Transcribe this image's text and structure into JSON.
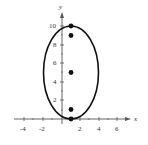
{
  "diagram": {
    "type": "ellipse-plot",
    "axes": {
      "x_label": "x",
      "y_label": "y",
      "x_ticks": [
        "-4",
        "-2",
        "2",
        "4",
        "6"
      ],
      "y_ticks": [
        "2",
        "4",
        "6",
        "8",
        "10"
      ],
      "xlim": [
        -5,
        7
      ],
      "ylim": [
        0,
        11
      ]
    },
    "ellipse": {
      "center": [
        1,
        5
      ],
      "semi_major_vertical": 5,
      "semi_minor_horizontal": 3
    },
    "points": [
      {
        "name": "vertex-top",
        "x": 1,
        "y": 10
      },
      {
        "name": "focus-top",
        "x": 1,
        "y": 9
      },
      {
        "name": "center",
        "x": 1,
        "y": 5
      },
      {
        "name": "focus-bottom",
        "x": 1,
        "y": 1
      },
      {
        "name": "vertex-bottom",
        "x": 1,
        "y": 0
      }
    ]
  }
}
